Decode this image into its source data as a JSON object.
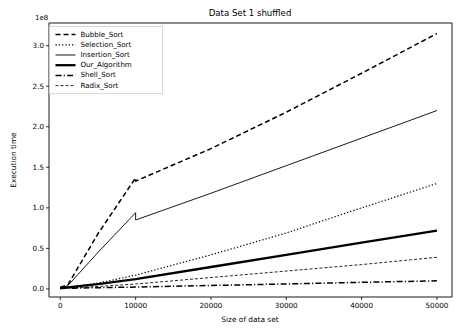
{
  "figure": {
    "title": "Data Set 1 shuffled",
    "background_color": "#ffffff",
    "line_color": "#000000"
  },
  "axes": {
    "x_label": "Size of data set",
    "y_label": "Execution time",
    "y_offset_text": "1e8",
    "x_ticks": [
      "0",
      "10000",
      "20000",
      "30000",
      "40000",
      "50000"
    ],
    "y_ticks": [
      "0.0",
      "0.5",
      "1.0",
      "1.5",
      "2.0",
      "2.5",
      "3.0"
    ]
  },
  "legend": {
    "entries": [
      {
        "label": "Bubble_Sort",
        "style": "dashed"
      },
      {
        "label": "Selection_Sort",
        "style": "dotted"
      },
      {
        "label": "Insertion_Sort",
        "style": "solid-thin"
      },
      {
        "label": "Our_Algorithm",
        "style": "solid-thick"
      },
      {
        "label": "Shell_Sort",
        "style": "dashdot"
      },
      {
        "label": "Radix_Sort",
        "style": "finedash"
      }
    ]
  },
  "chart_data": {
    "type": "line",
    "title": "Data Set 1 shuffled",
    "xlabel": "Size of data set",
    "ylabel": "Execution time",
    "y_offset": "1e8",
    "xlim": [
      -1500,
      52000
    ],
    "ylim": [
      -0.1,
      3.28
    ],
    "grid": false,
    "legend_position": "upper left",
    "x_ticks": [
      0,
      10000,
      20000,
      30000,
      40000,
      50000
    ],
    "y_ticks": [
      0.0,
      0.5,
      1.0,
      1.5,
      2.0,
      2.5,
      3.0
    ],
    "series": [
      {
        "name": "Bubble_Sort",
        "style": "dashed",
        "x": [
          0,
          1000,
          5000,
          10000,
          10000,
          20000,
          30000,
          40000,
          50000
        ],
        "y": [
          0.02,
          0.05,
          0.68,
          1.37,
          1.33,
          1.73,
          2.18,
          2.66,
          3.15
        ]
      },
      {
        "name": "Selection_Sort",
        "style": "dotted",
        "x": [
          0,
          1000,
          5000,
          10000,
          20000,
          30000,
          40000,
          50000
        ],
        "y": [
          0.01,
          0.02,
          0.07,
          0.17,
          0.42,
          0.69,
          1.0,
          1.3
        ]
      },
      {
        "name": "Insertion_Sort",
        "style": "solid-thin",
        "x": [
          0,
          1000,
          5000,
          10000,
          10000,
          20000,
          30000,
          40000,
          50000
        ],
        "y": [
          0.01,
          0.04,
          0.45,
          0.94,
          0.85,
          1.18,
          1.52,
          1.86,
          2.2
        ]
      },
      {
        "name": "Our_Algorithm",
        "style": "solid-thick",
        "x": [
          0,
          1000,
          5000,
          10000,
          20000,
          30000,
          40000,
          50000
        ],
        "y": [
          0.01,
          0.02,
          0.06,
          0.12,
          0.27,
          0.42,
          0.57,
          0.72
        ]
      },
      {
        "name": "Shell_Sort",
        "style": "dashdot",
        "x": [
          0,
          1000,
          5000,
          10000,
          20000,
          30000,
          40000,
          50000
        ],
        "y": [
          0.005,
          0.008,
          0.015,
          0.023,
          0.042,
          0.061,
          0.081,
          0.1
        ]
      },
      {
        "name": "Radix_Sort",
        "style": "finedash",
        "x": [
          0,
          1000,
          5000,
          10000,
          20000,
          30000,
          40000,
          50000
        ],
        "y": [
          0.005,
          0.01,
          0.03,
          0.06,
          0.14,
          0.22,
          0.3,
          0.39
        ]
      }
    ]
  }
}
